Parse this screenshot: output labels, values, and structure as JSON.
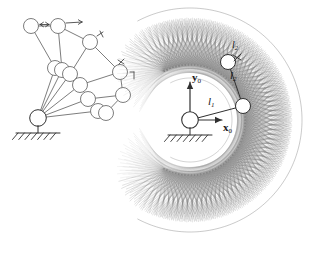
{
  "figure": {
    "panels": [
      {
        "id": "left-panel",
        "name": "manipulator-configurations",
        "description": "Superimposed configurations of a planar two-link arm pivoting about a grounded base",
        "base": {
          "x": 38,
          "y": 118
        },
        "ground": {
          "x": 38,
          "y": 133,
          "width": 44,
          "hatch_count": 7
        },
        "joint_radius": 7.5,
        "configurations": [
          {
            "elbow": {
              "x": 55,
              "y": 68
            },
            "tip": {
              "x": 31,
              "y": 26
            }
          },
          {
            "elbow": {
              "x": 62,
              "y": 70
            },
            "tip": {
              "x": 58,
              "y": 26
            }
          },
          {
            "elbow": {
              "x": 70,
              "y": 74
            },
            "tip": {
              "x": 90,
              "y": 42
            }
          },
          {
            "elbow": {
              "x": 80,
              "y": 85
            },
            "tip": {
              "x": 120,
              "y": 72
            }
          },
          {
            "elbow": {
              "x": 88,
              "y": 99
            },
            "tip": {
              "x": 123,
              "y": 95
            }
          },
          {
            "elbow": {
              "x": 98,
              "y": 111
            },
            "tip": {
              "x": 106,
              "y": 113
            }
          }
        ],
        "outline_links": [
          {
            "from": {
              "x": 31,
              "y": 26
            },
            "to": {
              "x": 58,
              "y": 26
            }
          },
          {
            "from": {
              "x": 58,
              "y": 26
            },
            "to": {
              "x": 90,
              "y": 42
            }
          },
          {
            "from": {
              "x": 90,
              "y": 42
            },
            "to": {
              "x": 120,
              "y": 72
            }
          },
          {
            "from": {
              "x": 120,
              "y": 72
            },
            "to": {
              "x": 123,
              "y": 95
            }
          },
          {
            "from": {
              "x": 123,
              "y": 95
            },
            "to": {
              "x": 106,
              "y": 113
            }
          }
        ]
      },
      {
        "id": "right-panel",
        "name": "workspace-plot",
        "description": "Crescent-shaped reachable workspace swept by the two-link arm, drawn as a dense web of link traces",
        "base": {
          "x": 190,
          "y": 120
        },
        "ground": {
          "x": 190,
          "y": 135,
          "width": 44,
          "hatch_count": 7
        },
        "joint_radius": 7.5,
        "elbow_joint": {
          "x": 243,
          "y": 106
        },
        "wrist_joint": {
          "x": 228,
          "y": 62
        },
        "link1_length": 55,
        "link2_length": 47,
        "workspace": {
          "shape": "crescent",
          "opening_direction": "left",
          "outer_radius": 112,
          "inner_radius": 42,
          "angle_start_deg": -118,
          "angle_end_deg": 118,
          "trace_count": 72
        }
      }
    ],
    "labels": {
      "y_axis": {
        "symbol": "y",
        "subscript": "0",
        "bold": true
      },
      "x_axis": {
        "symbol": "x",
        "subscript": "0",
        "bold": true
      },
      "link1": {
        "symbol": "l",
        "subscript": "1",
        "italic": true
      },
      "link2": {
        "symbol": "l",
        "subscript": "2",
        "italic": true
      },
      "link2_upper": {
        "symbol": "l",
        "subscript": "2",
        "italic": true
      }
    },
    "colors": {
      "line": "#6e6e6e",
      "dark_line": "#303030",
      "web": "#9a9a9a",
      "web_dense": "#6a6a6a",
      "text": "#1a1a1a",
      "background": "#ffffff"
    }
  }
}
